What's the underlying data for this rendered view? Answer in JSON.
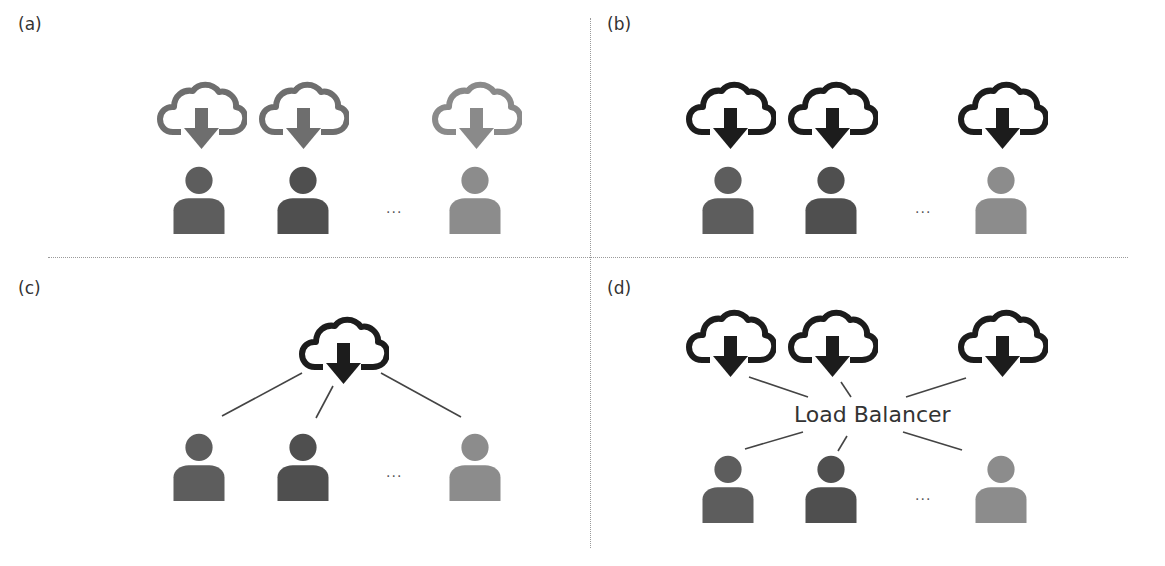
{
  "panels": [
    {
      "label": "(a)",
      "description": "Each user has own cloud download source (grey, individual)"
    },
    {
      "label": "(b)",
      "description": "Each user has own cloud download source (dark)"
    },
    {
      "label": "(c)",
      "description": "Single cloud shared by all users"
    },
    {
      "label": "(d)",
      "description": "Multiple clouds connected to users via load balancer"
    }
  ],
  "ellipsis": "...",
  "load_balancer_label": "Load Balancer",
  "colors": {
    "cloud_grey": "#6e6e6e",
    "cloud_light": "#8a8a8a",
    "cloud_dark": "#1c1c1c",
    "user_1": "#5d5d5d",
    "user_2": "#4f4f4f",
    "user_3": "#8c8c8c",
    "divider": "#9a9a9a",
    "line": "#444444"
  }
}
